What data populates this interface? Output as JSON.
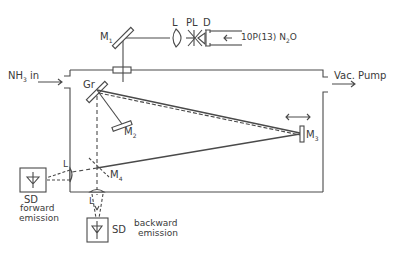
{
  "diagram": {
    "type": "optical setup schematic",
    "colors": {
      "line": "#4a4a4a",
      "background": "#ffffff"
    },
    "labels": {
      "m1": "M",
      "m1_sub": "1",
      "lens_top": "L",
      "pl": "PL",
      "d": "D",
      "source": "10P(13) N",
      "source_sub": "2",
      "source_tail": "O",
      "nh3": "NH",
      "nh3_sub": "3",
      "nh3_tail": " in",
      "vac": "Vac. Pump",
      "gr": "Gr",
      "m2": "M",
      "m2_sub": "2",
      "m3": "M",
      "m3_sub": "3",
      "m4": "M",
      "m4_sub": "4",
      "lens_fwd": "L",
      "lens_bwd": "L",
      "sd_fwd": "SD",
      "fwd_line1": "forward",
      "fwd_line2": "emission",
      "sd_bwd": "SD",
      "bwd_line1": "backward",
      "bwd_line2": "emission"
    },
    "components": [
      "M1 mirror",
      "L lens",
      "PL polarizer",
      "D diaphragm",
      "10P(13) N2O laser input",
      "NH3 inlet",
      "Vacuum pump outlet",
      "Gr grating",
      "M2 mirror",
      "M3 movable mirror",
      "M4 beam splitter",
      "SD forward emission detector",
      "SD backward emission detector"
    ]
  }
}
